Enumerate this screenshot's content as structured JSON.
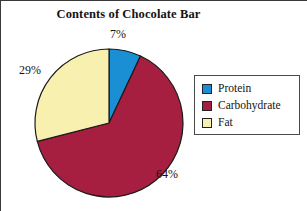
{
  "figure": {
    "title": "Contents of Chocolate Bar",
    "background": "#ffffff"
  },
  "legend": {
    "position": "right",
    "entries": [
      {
        "label": "Protein",
        "color": "#1B8FD4"
      },
      {
        "label": "Carbohydrate",
        "color": "#A61E40"
      },
      {
        "label": "Fat",
        "color": "#F7F0AF"
      }
    ]
  },
  "labels": {
    "protein": "7%",
    "carbohydrate": "64%",
    "fat": "29%"
  },
  "chart_data": {
    "type": "pie",
    "title": "Contents of Chocolate Bar",
    "xlabel": "",
    "ylabel": "",
    "categories": [
      "Protein",
      "Carbohydrate",
      "Fat"
    ],
    "values": [
      7,
      64,
      29
    ],
    "value_labels": [
      "7%",
      "64%",
      "29%"
    ],
    "units": "percent",
    "total": 100,
    "colors": [
      "#1B8FD4",
      "#A61E40",
      "#F7F0AF"
    ],
    "start_angle_deg": 0,
    "direction": "clockwise",
    "legend": "right",
    "grid": false,
    "slice_border_color": "#1a1a1a"
  }
}
